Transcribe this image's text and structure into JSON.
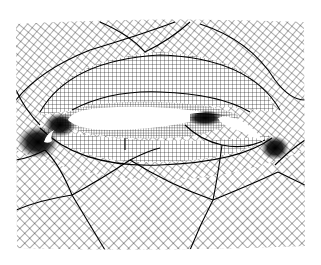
{
  "figure": {
    "description": "Multiblock structured computational mesh around a three-element high-lift airfoil",
    "elements": [
      {
        "name": "slat",
        "role": "leading-edge slat"
      },
      {
        "name": "main",
        "role": "main element"
      },
      {
        "name": "flap",
        "role": "trailing-edge flap"
      }
    ],
    "colors": {
      "background": "#ffffff",
      "grid_line": "#1a1a1a",
      "block_boundary": "#000000",
      "airfoil_fill": "#ffffff"
    },
    "mesh_bounds": {
      "x0": 16,
      "y0": 20,
      "x1": 305,
      "y1": 250
    }
  }
}
